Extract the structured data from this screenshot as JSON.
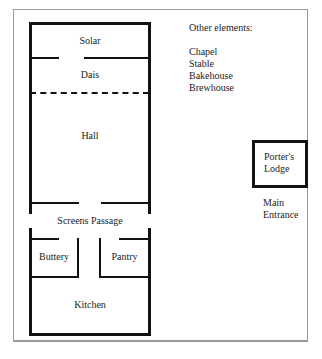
{
  "diagram": {
    "rooms": {
      "solar": "Solar",
      "dais": "Dais",
      "hall": "Hall",
      "screens_passage": "Screens Passage",
      "buttery": "Buttery",
      "pantry": "Pantry",
      "kitchen": "Kitchen"
    },
    "other_elements": {
      "heading": "Other elements:",
      "items": [
        "Chapel",
        "Stable",
        "Bakehouse",
        "Brewhouse"
      ]
    },
    "porters_lodge": {
      "line1": "Porter's",
      "line2": "Lodge"
    },
    "main_entrance": {
      "line1": "Main",
      "line2": "Entrance"
    },
    "colors": {
      "wall": "#111111",
      "frame": "#9a9a9a",
      "background": "#ffffff"
    }
  }
}
